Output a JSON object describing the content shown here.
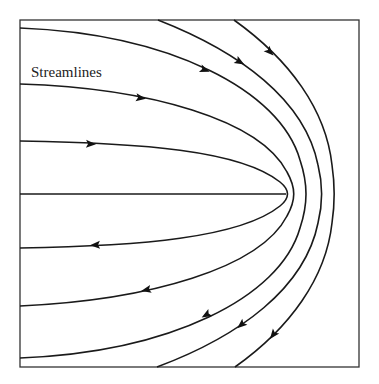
{
  "figure": {
    "label": "Streamlines",
    "description_type": "streamline flow diagram",
    "colors": {
      "stroke": "#1a1a1a",
      "frame": "#333333",
      "background": "#ffffff"
    }
  },
  "frame": {
    "x": 20,
    "y": 20,
    "width": 339,
    "height": 347
  },
  "streamlines": [
    {
      "id": "s1",
      "d": "M20,141 C140,143 240,150 280,182 C290,190 290,198 280,206 C240,238 140,246 20,248"
    },
    {
      "id": "s2",
      "d": "M20,84 C150,88 260,120 287,172 C296,188 296,200 287,216 C260,268 150,300 20,306"
    },
    {
      "id": "s3",
      "d": "M20,28 C170,34 280,90 300,160 C308,184 308,204 300,228 C280,298 170,352 20,358"
    },
    {
      "id": "s4",
      "d": "M158,20 C240,52 305,100 318,165 C323,185 323,203 318,223 C305,288 240,336 157,367"
    },
    {
      "id": "s5",
      "d": "M234,20 C290,60 326,110 332,165 C335,185 335,203 332,223 C326,278 290,328 235,367"
    },
    {
      "id": "axis",
      "d": "M20,194 L286,194"
    }
  ],
  "arrows": [
    {
      "id": "a1",
      "x": 91,
      "y": 144,
      "angle": 2
    },
    {
      "id": "a2",
      "x": 141,
      "y": 98,
      "angle": 8
    },
    {
      "id": "a3",
      "x": 205,
      "y": 70,
      "angle": 20
    },
    {
      "id": "a4",
      "x": 240,
      "y": 62,
      "angle": 30
    },
    {
      "id": "a5",
      "x": 270,
      "y": 52,
      "angle": 45
    },
    {
      "id": "a6",
      "x": 95,
      "y": 245,
      "angle": 178
    },
    {
      "id": "a7",
      "x": 146,
      "y": 290,
      "angle": 168
    },
    {
      "id": "a8",
      "x": 206,
      "y": 315,
      "angle": 150
    },
    {
      "id": "a9",
      "x": 241,
      "y": 325,
      "angle": 140
    },
    {
      "id": "a10",
      "x": 273,
      "y": 335,
      "angle": 128
    }
  ],
  "label_position": {
    "x": 31,
    "y": 77
  }
}
